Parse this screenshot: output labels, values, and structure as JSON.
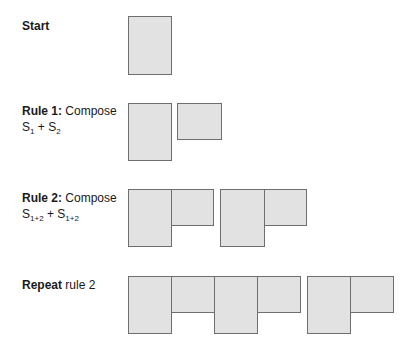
{
  "colors": {
    "fill": "#e2e2e2",
    "stroke": "#6e6e6e",
    "text": "#1a1a1a"
  },
  "rows": [
    {
      "id": "start",
      "label_bold": "Start",
      "label_rest": "",
      "line2_parts": []
    },
    {
      "id": "rule1",
      "label_bold": "Rule 1:",
      "label_rest": " Compose",
      "line2": {
        "a": "S",
        "a_sub": "1",
        "plus": " + ",
        "b": "S",
        "b_sub": "2"
      }
    },
    {
      "id": "rule2",
      "label_bold": "Rule 2:",
      "label_rest": " Compose",
      "line2": {
        "a": "S",
        "a_sub": "1+2",
        "plus": " + ",
        "b": "S",
        "b_sub": "1+2"
      }
    },
    {
      "id": "repeat",
      "label_bold": "Repeat",
      "label_rest": " rule 2"
    }
  ],
  "shapes": {
    "start": [
      {
        "kind": "tall",
        "x": 128,
        "y": 16,
        "w": 44,
        "h": 59
      }
    ],
    "rule1": [
      {
        "kind": "tall",
        "x": 128,
        "y": 103,
        "w": 44,
        "h": 58
      },
      {
        "kind": "square",
        "x": 177,
        "y": 103,
        "w": 45,
        "h": 37
      }
    ],
    "rule2": [
      {
        "kind": "tall",
        "x": 128,
        "y": 189,
        "w": 44,
        "h": 58
      },
      {
        "kind": "square",
        "x": 171,
        "y": 189,
        "w": 43,
        "h": 37
      },
      {
        "kind": "tall",
        "x": 220,
        "y": 189,
        "w": 45,
        "h": 58
      },
      {
        "kind": "square",
        "x": 264,
        "y": 189,
        "w": 43,
        "h": 37
      }
    ],
    "repeat": [
      {
        "kind": "tall",
        "x": 128,
        "y": 276,
        "w": 44,
        "h": 58
      },
      {
        "kind": "square",
        "x": 171,
        "y": 276,
        "w": 44,
        "h": 37
      },
      {
        "kind": "tall",
        "x": 214,
        "y": 276,
        "w": 44,
        "h": 58
      },
      {
        "kind": "square",
        "x": 257,
        "y": 276,
        "w": 44,
        "h": 37
      },
      {
        "kind": "tall",
        "x": 307,
        "y": 276,
        "w": 44,
        "h": 58
      },
      {
        "kind": "square",
        "x": 350,
        "y": 276,
        "w": 44,
        "h": 37
      }
    ]
  }
}
